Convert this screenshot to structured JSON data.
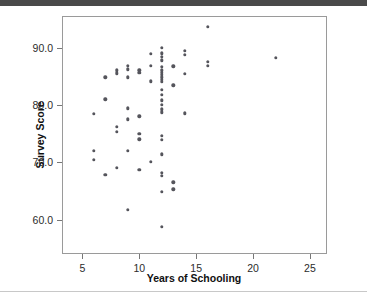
{
  "figure": {
    "background_color": "#ffffff",
    "top_bar_color": "#4a4a4a",
    "frame_color": "#9a9a9a",
    "point_color": "#55555c"
  },
  "chart_data": {
    "type": "scatter",
    "title": "",
    "xlabel": "Years of Schooling",
    "ylabel": "Survey Score",
    "xlim": [
      3.2,
      26.5
    ],
    "ylim": [
      54.0,
      95.5
    ],
    "xticks": [
      5,
      10,
      15,
      20,
      25
    ],
    "xticklabels": [
      "5",
      "10",
      "15",
      "20",
      "25"
    ],
    "yticks": [
      60.0,
      70.0,
      80.0,
      90.0
    ],
    "yticklabels": [
      "60.0",
      "70.0",
      "80.0",
      "90.0"
    ],
    "grid": false,
    "legend": null,
    "marker": "circle",
    "points": [
      [
        6,
        78.4
      ],
      [
        6,
        72.0
      ],
      [
        6,
        70.4
      ],
      [
        7,
        84.8
      ],
      [
        7,
        81.0
      ],
      [
        7,
        67.8
      ],
      [
        8,
        86.0
      ],
      [
        8,
        85.5
      ],
      [
        8,
        76.2
      ],
      [
        8,
        75.3
      ],
      [
        8,
        69.0
      ],
      [
        9,
        86.8
      ],
      [
        9,
        86.2
      ],
      [
        9,
        84.8
      ],
      [
        9,
        79.4
      ],
      [
        9,
        77.5
      ],
      [
        9,
        72.0
      ],
      [
        9,
        61.7
      ],
      [
        10,
        86.0
      ],
      [
        10,
        85.6
      ],
      [
        10,
        78.0
      ],
      [
        10,
        75.0
      ],
      [
        10,
        74.0
      ],
      [
        10,
        68.7
      ],
      [
        11,
        88.9
      ],
      [
        11,
        86.8
      ],
      [
        11,
        84.1
      ],
      [
        11,
        70.1
      ],
      [
        12,
        90.0
      ],
      [
        12,
        89.0
      ],
      [
        12,
        88.4
      ],
      [
        12,
        87.8
      ],
      [
        12,
        86.6
      ],
      [
        12,
        86.0
      ],
      [
        12,
        85.6
      ],
      [
        12,
        85.2
      ],
      [
        12,
        84.8
      ],
      [
        12,
        84.4
      ],
      [
        12,
        84.0
      ],
      [
        12,
        82.6
      ],
      [
        12,
        81.8
      ],
      [
        12,
        80.8
      ],
      [
        12,
        80.0
      ],
      [
        12,
        79.2
      ],
      [
        12,
        78.7
      ],
      [
        12,
        74.6
      ],
      [
        12,
        73.9
      ],
      [
        12,
        71.4
      ],
      [
        12,
        68.2
      ],
      [
        12,
        67.6
      ],
      [
        12,
        64.8
      ],
      [
        12,
        58.7
      ],
      [
        13,
        86.7
      ],
      [
        13,
        83.4
      ],
      [
        13,
        66.5
      ],
      [
        13,
        65.3
      ],
      [
        14,
        89.4
      ],
      [
        14,
        88.7
      ],
      [
        14,
        85.4
      ],
      [
        14,
        78.5
      ],
      [
        16,
        93.6
      ],
      [
        16,
        87.5
      ],
      [
        16,
        86.8
      ],
      [
        22,
        88.2
      ]
    ]
  }
}
